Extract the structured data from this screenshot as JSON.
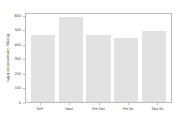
{
  "chart_data": {
    "type": "bar",
    "title": "",
    "xlabel": "",
    "ylabel": "Energy Consumed (in kWh)",
    "categories": [
      "Self",
      "Nest",
      "Pre-Sav",
      "Pre-Tst",
      "Sea-Tst"
    ],
    "values": [
      470,
      600,
      470,
      450,
      500
    ],
    "ylim": [
      0,
      620
    ],
    "yticks": [
      0,
      100,
      200,
      300,
      400,
      500,
      600
    ],
    "ytick_labels": [
      "0",
      "100",
      "200",
      "300",
      "400",
      "500",
      "600"
    ],
    "grid": false,
    "legend": null,
    "bar_color": "#e2e2e2",
    "axis_color": "#b9b9b9",
    "text_color": "#4a4a4a",
    "background": "#ffffff"
  }
}
